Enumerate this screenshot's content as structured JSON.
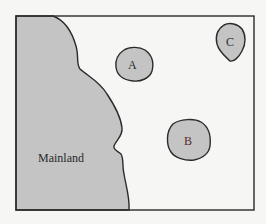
{
  "map": {
    "background_color": "#f6f6f4",
    "land_color": "#c4c4c4",
    "outline_color": "#2b2b2b",
    "mainland": {
      "label": "Mainland"
    },
    "islands": [
      {
        "id": "A",
        "label": "A"
      },
      {
        "id": "B",
        "label": "B"
      },
      {
        "id": "C",
        "label": "C"
      }
    ]
  }
}
